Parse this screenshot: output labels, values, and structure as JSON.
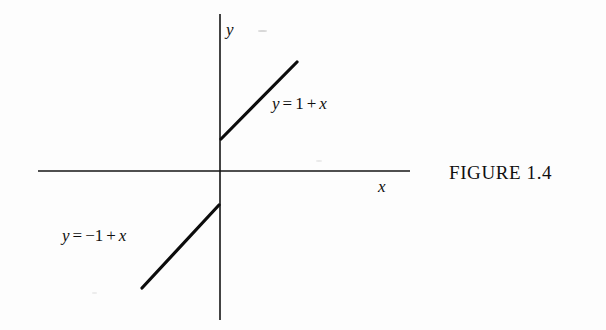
{
  "figure": {
    "caption": "FIGURE 1.4",
    "background_color": "#fdfdfd",
    "ink_color": "#0e0e0e"
  },
  "axes": {
    "x_label": "x",
    "y_label": "y",
    "origin": {
      "x": 220,
      "y": 171
    },
    "x_axis": {
      "x1": 38,
      "y1": 171,
      "x2": 410,
      "y2": 171
    },
    "y_axis": {
      "x1": 220,
      "y1": 14,
      "x2": 220,
      "y2": 320
    },
    "stroke_width": 1.6
  },
  "chart_data": {
    "type": "line",
    "title": "FIGURE 1.4",
    "xlabel": "x",
    "ylabel": "y",
    "grid": false,
    "legend": "inline-annotations",
    "axis_style": "centered-cross",
    "series": [
      {
        "name": "y = 1 + x",
        "label": "y = 1 + x",
        "slope": 1,
        "intercept": 1,
        "domain": "x >= 0",
        "pixel_endpoints": {
          "x1": 221,
          "y1": 139,
          "x2": 297,
          "y2": 62
        },
        "stroke_width": 3.2
      },
      {
        "name": "y = -1 + x",
        "label": "y = −1 + x",
        "slope": 1,
        "intercept": -1,
        "domain": "x <= 0",
        "pixel_endpoints": {
          "x1": 142,
          "y1": 288,
          "x2": 219,
          "y2": 205
        },
        "stroke_width": 3.2
      }
    ],
    "annotations": [
      {
        "text": "y = 1 + x",
        "x": 272,
        "y": 95
      },
      {
        "text": "y = −1 + x",
        "x": 62,
        "y": 227
      }
    ]
  },
  "equations": {
    "upper": {
      "lhs": "y",
      "eq": "=",
      "term1": "1",
      "plus": "+",
      "term2": "x"
    },
    "lower": {
      "lhs": "y",
      "eq": "=",
      "term1": "−1",
      "plus": "+",
      "term2": "x"
    }
  }
}
